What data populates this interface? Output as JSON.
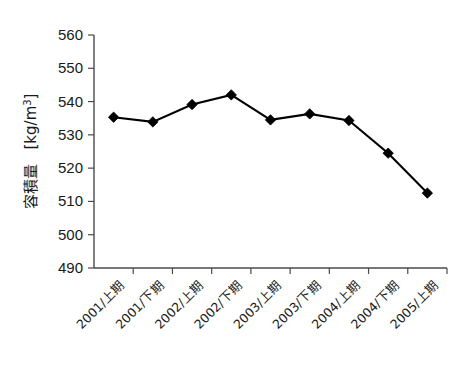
{
  "chart_data": {
    "type": "line",
    "title": "",
    "xlabel": "",
    "ylabel": "容積量 [kg/m3]",
    "ylabel_main": "容積量",
    "ylabel_unit": "[kg/m",
    "ylabel_unit_exp": "3",
    "ylabel_unit_close": "]",
    "categories": [
      "2001/上期",
      "2001/下期",
      "2002/上期",
      "2002/下期",
      "2003/上期",
      "2003/下期",
      "2004/上期",
      "2004/下期",
      "2005/上期"
    ],
    "values": [
      535.3,
      533.9,
      539.1,
      542.0,
      534.5,
      536.3,
      534.3,
      524.5,
      512.5
    ],
    "ylim": [
      490,
      560
    ],
    "yticks": [
      490,
      500,
      510,
      520,
      530,
      540,
      550,
      560
    ],
    "ytick_labels": [
      "490",
      "500",
      "510",
      "520",
      "530",
      "540",
      "550",
      "560"
    ],
    "grid": false,
    "legend": null,
    "legend_position": "none",
    "marker": "diamond",
    "line_color": "#000000",
    "marker_color": "#000000",
    "axis_color": "#4a4a4a",
    "background_color": "#ffffff",
    "xtick_rotation": -45,
    "series_name": "容積量"
  }
}
